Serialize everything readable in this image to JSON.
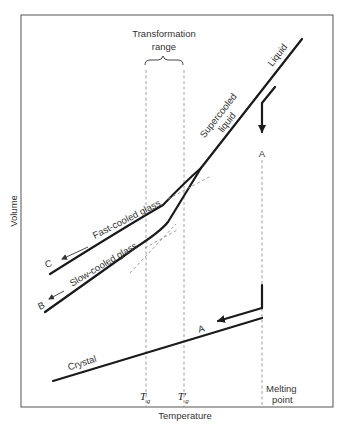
{
  "diagram": {
    "axes": {
      "x_label": "Temperature",
      "y_label": "Volume"
    },
    "region_label": {
      "line1": "Transformation",
      "line2": "range"
    },
    "curve_labels": {
      "liquid": "Liquid",
      "supercooled_line1": "Supercooled",
      "supercooled_line2": "liquid",
      "fast_cooled": "Fast-cooled glass",
      "slow_cooled": "Slow-cooled glass",
      "crystal": "Crystal"
    },
    "path_markers": {
      "a_top": "A",
      "a_bottom": "A",
      "b": "B",
      "c": "C"
    },
    "temperature_markers": {
      "tg": "T",
      "tg_sub": "g",
      "tg_prime": "T′",
      "tg_prime_sub": "g",
      "melting_line1": "Melting",
      "melting_line2": "point"
    },
    "colors": {
      "curve": "#1a1a1a",
      "dashed": "#888888",
      "frame": "#555555",
      "text": "#333333"
    }
  }
}
